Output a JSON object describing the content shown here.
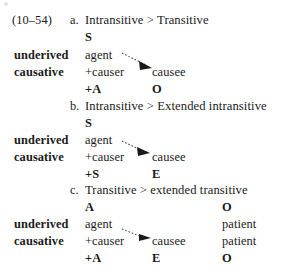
{
  "figure": {
    "example_number": "(10–54)",
    "row_labels": {
      "underived": "underived",
      "causative": "causative"
    },
    "items": [
      {
        "letter": "a.",
        "heading": "Intransitive > Transitive",
        "function_row": {
          "col1": "S",
          "col2": ""
        },
        "underived_row": {
          "col1": "agent",
          "col2": ""
        },
        "causative_row": {
          "col1": "+causer",
          "col2": "causee",
          "col3": ""
        },
        "result_row": {
          "col1": "+A",
          "col2": "O",
          "col3": ""
        },
        "arrow": {
          "from_label": "+causer",
          "to_label": "causee",
          "style": "dotted-arrow"
        }
      },
      {
        "letter": "b.",
        "heading": "Intransitive > Extended intransitive",
        "function_row": {
          "col1": "S",
          "col2": ""
        },
        "underived_row": {
          "col1": "agent",
          "col2": ""
        },
        "causative_row": {
          "col1": "+causer",
          "col2": "causee",
          "col3": ""
        },
        "result_row": {
          "col1": "+S",
          "col2": "E",
          "col3": ""
        },
        "arrow": {
          "from_label": "+causer",
          "to_label": "causee",
          "style": "dotted-arrow"
        }
      },
      {
        "letter": "c.",
        "heading": "Transitive > extended transitive",
        "function_row": {
          "col1": "A",
          "col2": "",
          "col3": "O"
        },
        "underived_row": {
          "col1": "agent",
          "col2": "",
          "col3": "patient"
        },
        "causative_row": {
          "col1": "+causer",
          "col2": "causee",
          "col3": "patient"
        },
        "result_row": {
          "col1": "+A",
          "col2": "E",
          "col3": "O"
        },
        "arrow": {
          "from_label": "+causer",
          "to_label": "causee",
          "style": "dotted-arrow"
        }
      }
    ]
  }
}
